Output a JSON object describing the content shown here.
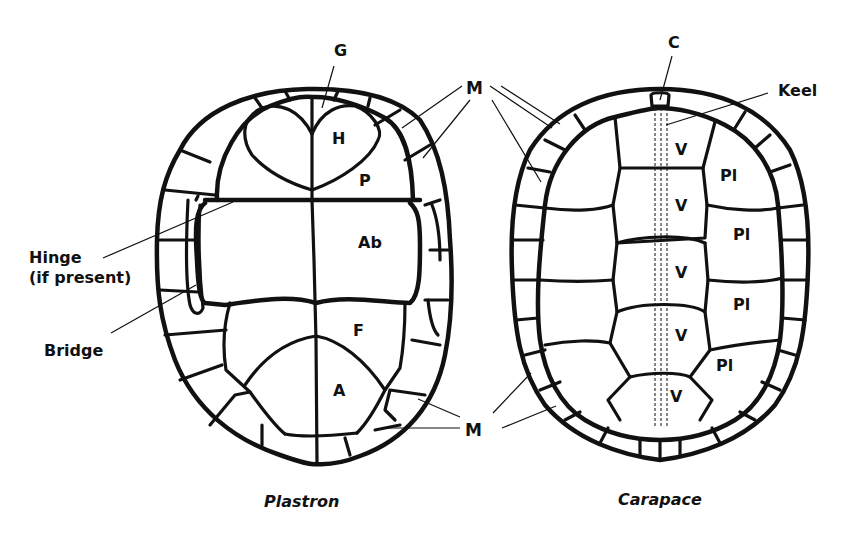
{
  "figure": {
    "plastron": {
      "caption": "Plastron",
      "labels": {
        "gular": "G",
        "humeral": "H",
        "pectoral": "P",
        "abdominal": "Ab",
        "femoral": "F",
        "anal": "A",
        "marginal_top": "M",
        "marginal_bottom": "M",
        "hinge_line1": "Hinge",
        "hinge_line2": "(if present)",
        "bridge": "Bridge"
      }
    },
    "carapace": {
      "caption": "Carapace",
      "labels": {
        "cervical": "C",
        "keel": "Keel",
        "vertebrals": [
          "V",
          "V",
          "V",
          "V",
          "V"
        ],
        "pleurals": [
          "Pl",
          "Pl",
          "Pl",
          "Pl"
        ]
      }
    },
    "colors": {
      "ink": "#111111",
      "background": "#ffffff"
    }
  }
}
